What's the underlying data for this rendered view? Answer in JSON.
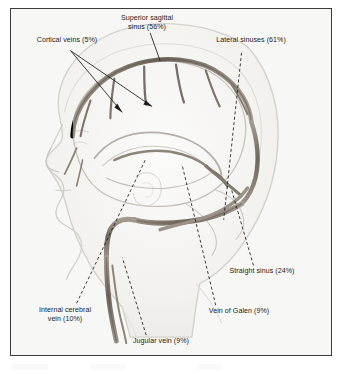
{
  "figure": {
    "type": "anatomical-diagram",
    "frame": {
      "border_color": "#3b3b3b",
      "background_color": "#f7f7f5"
    },
    "palette": {
      "vessel_color": "#8c8278",
      "vessel_dark": "#6d6459",
      "head_outline": "#d2d2cd",
      "brain_outline": "#b9b5ae",
      "leader_line": "#1b1b1b",
      "label_text": "#1b1b1b"
    },
    "labels": [
      {
        "name": "superior-sagittal-sinus",
        "line1": "Superior sagittal",
        "line2": "sinus (56%)",
        "structure": "Superior sagittal sinus",
        "percent": "56%"
      },
      {
        "name": "cortical-veins",
        "line1": "Cortical veins (5%)",
        "line2": "",
        "structure": "Cortical veins",
        "percent": "5%"
      },
      {
        "name": "lateral-sinuses",
        "line1": "Lateral sinuses (61%)",
        "line2": "",
        "structure": "Lateral sinuses",
        "percent": "61%"
      },
      {
        "name": "straight-sinus",
        "line1": "Straight sinus (24%)",
        "line2": "",
        "structure": "Straight sinus",
        "percent": "24%"
      },
      {
        "name": "internal-cerebral-vein",
        "line1": "Internal cerebral",
        "line2": "vein (10%)",
        "structure": "Internal cerebral vein",
        "percent": "10%"
      },
      {
        "name": "vein-of-galen",
        "line1": "Vein of Galen (9%)",
        "line2": "",
        "structure": "Vein of Galen",
        "percent": "9%"
      },
      {
        "name": "jugular-vein",
        "line1": "Jugular vein (9%)",
        "line2": "",
        "structure": "Jugular vein",
        "percent": "9%"
      }
    ]
  }
}
